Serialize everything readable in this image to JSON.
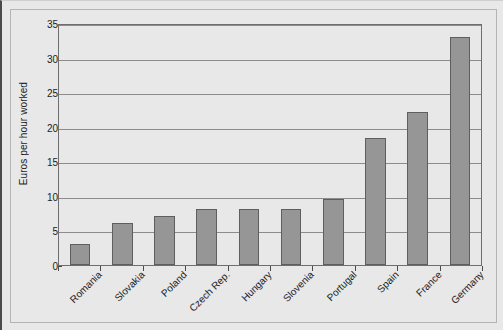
{
  "chart_data": {
    "type": "bar",
    "title": "",
    "subtitle": "",
    "xlabel": "",
    "ylabel": "Euros per hour worked",
    "categories": [
      "Romania",
      "Slovakia",
      "Poland",
      "Czech Rep.",
      "Hungary",
      "Slovenia",
      "Portugal",
      "Spain",
      "France",
      "Germany"
    ],
    "values": [
      3.1,
      6.1,
      7.1,
      8.1,
      8.1,
      8.1,
      9.6,
      18.3,
      22.2,
      33.0
    ],
    "ylim": [
      0,
      35
    ],
    "yticks": [
      0,
      5,
      10,
      15,
      20,
      25,
      30,
      35
    ],
    "ytick_labels": [
      "0",
      "5",
      "10",
      "15",
      "20",
      "25",
      "30",
      "35"
    ],
    "grid": true,
    "grid_axis": "y",
    "legend": false,
    "legend_position": "none",
    "bar_color": "#969696",
    "bar_border_color": "#5e5e5e",
    "plot_background": "#e8e8e8",
    "gridline_color": "#8c8c8c",
    "axis_color": "#6e6e6e",
    "text_color": "#1c1c1c",
    "xtick_label_rotation": -45
  }
}
